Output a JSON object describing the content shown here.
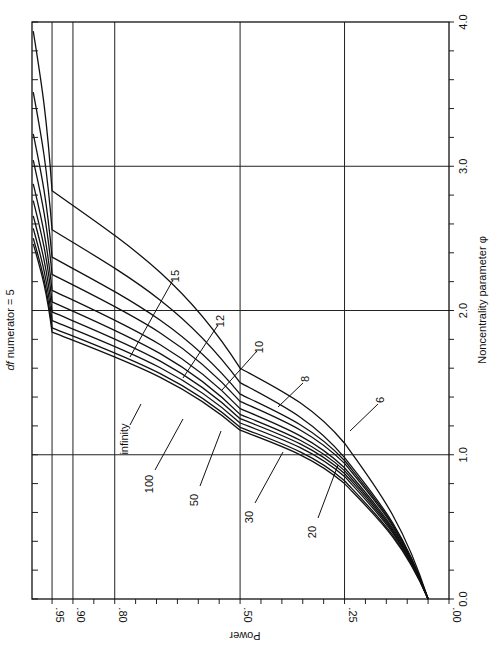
{
  "chart_data": {
    "type": "line",
    "title": "df numerator = 5",
    "title_italic_part": "df",
    "title_rest": " numerator = 5",
    "xlabel": "Noncentrality parameter φ",
    "ylabel": "Power",
    "orientation": "rotated 90° clockwise (phi axis vertical on right, power axis horizontal at bottom, labels rotated)",
    "xlim": [
      0.0,
      4.0
    ],
    "ylim": [
      0.0,
      1.0
    ],
    "x_ticks": [
      "0.0",
      "1.0",
      "2.0",
      "3.0",
      "4.0"
    ],
    "y_ticks": [
      ".00",
      ".25",
      ".50",
      ".80",
      ".90",
      ".95"
    ],
    "grid": true,
    "legend": "inline curve labels (denominator df)",
    "power_levels_sampled": [
      0.05,
      0.25,
      0.5,
      0.95
    ],
    "series": [
      {
        "name": "6",
        "phi": [
          0.0,
          1.08,
          1.6,
          2.83
        ]
      },
      {
        "name": "8",
        "phi": [
          0.0,
          0.98,
          1.5,
          2.56
        ]
      },
      {
        "name": "10",
        "phi": [
          0.0,
          0.96,
          1.42,
          2.37
        ]
      },
      {
        "name": "12",
        "phi": [
          0.0,
          0.94,
          1.37,
          2.25
        ]
      },
      {
        "name": "15",
        "phi": [
          0.0,
          0.91,
          1.32,
          2.14
        ]
      },
      {
        "name": "20",
        "phi": [
          0.0,
          0.89,
          1.28,
          2.06
        ]
      },
      {
        "name": "30",
        "phi": [
          0.0,
          0.87,
          1.25,
          1.99
        ]
      },
      {
        "name": "50",
        "phi": [
          0.0,
          0.85,
          1.22,
          1.93
        ]
      },
      {
        "name": "100",
        "phi": [
          0.0,
          0.82,
          1.19,
          1.88
        ]
      },
      {
        "name": "infinity",
        "phi": [
          0.0,
          0.8,
          1.17,
          1.85
        ]
      }
    ]
  }
}
